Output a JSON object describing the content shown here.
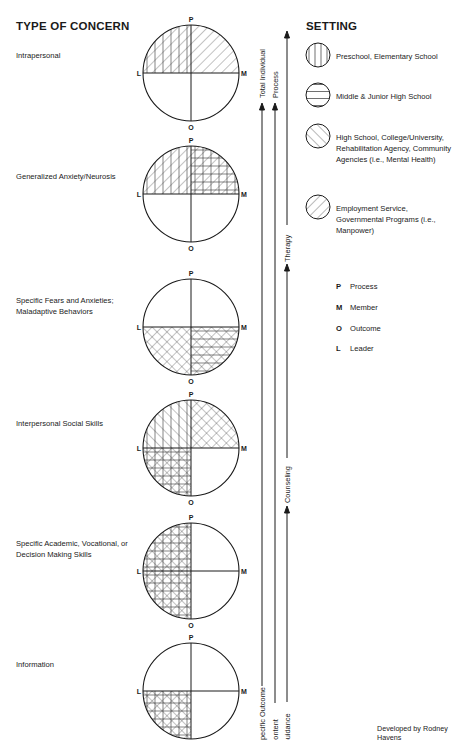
{
  "headings": {
    "type_of_concern": "TYPE OF CONCERN",
    "setting": "SETTING"
  },
  "concerns": [
    {
      "label": "Intrapersonal",
      "cy": 73
    },
    {
      "label": "Generalized Anxiety/Neurosis",
      "cy": 194
    },
    {
      "label": "Specific Fears and Anxieties; Maladaptive Behaviors",
      "cy": 327
    },
    {
      "label": "Interpersonal Social Skills",
      "cy": 448
    },
    {
      "label": "Specific Academic, Vocational, or Decision Making Skills",
      "cy": 571
    },
    {
      "label": "Information",
      "cy": 691
    }
  ],
  "quadrant_fills": {
    "circle_1": {
      "UL": [
        "vertical",
        "forward"
      ],
      "UR": [
        "forward"
      ],
      "LL": [],
      "LR": []
    },
    "circle_2": {
      "UL": [
        "vertical",
        "forward"
      ],
      "UR": [
        "vertical",
        "horizontal",
        "forward"
      ],
      "LL": [],
      "LR": []
    },
    "circle_3": {
      "UL": [],
      "UR": [],
      "LL": [
        "back",
        "forward"
      ],
      "LR": [
        "back",
        "forward",
        "horizontal"
      ]
    },
    "circle_4": {
      "UL": [
        "vertical",
        "back"
      ],
      "UR": [
        "back",
        "forward"
      ],
      "LL": [
        "vertical",
        "horizontal",
        "back",
        "forward"
      ],
      "LR": []
    },
    "circle_5": {
      "UL": [
        "vertical",
        "horizontal",
        "back",
        "forward"
      ],
      "UR": [],
      "LL": [
        "vertical",
        "horizontal",
        "back",
        "forward"
      ],
      "LR": []
    },
    "circle_6": {
      "UL": [],
      "UR": [],
      "LL": [
        "vertical",
        "horizontal",
        "back",
        "forward"
      ],
      "LR": []
    }
  },
  "axis_labels": {
    "top": "P",
    "right": "M",
    "bottom": "O",
    "left": "L"
  },
  "settings": [
    {
      "pattern": "vertical",
      "label": "Preschool, Elementary School"
    },
    {
      "pattern": "horizontal",
      "label": "Middle & Junior High School"
    },
    {
      "pattern": "back",
      "label": "High School, College/University, Rehabilitation Agency, Community Agencies (i.e., Mental Health)"
    },
    {
      "pattern": "forward",
      "label": "Employment Service, Governmental Programs (i.e., Manpower)"
    }
  ],
  "key": [
    {
      "letter": "P",
      "meaning": "Process"
    },
    {
      "letter": "M",
      "meaning": "Member"
    },
    {
      "letter": "O",
      "meaning": "Outcome"
    },
    {
      "letter": "L",
      "meaning": "Leader"
    }
  ],
  "continua": [
    {
      "bottom_label": "Specific Outcome",
      "top_label": "Total Individual"
    },
    {
      "bottom_label": "Content",
      "top_label": "Process"
    },
    {
      "bottom_label": "Guidance",
      "mid_labels": [
        "Counseling",
        "Therapy"
      ]
    }
  ],
  "credit": "Developed by Rodney Havens"
}
